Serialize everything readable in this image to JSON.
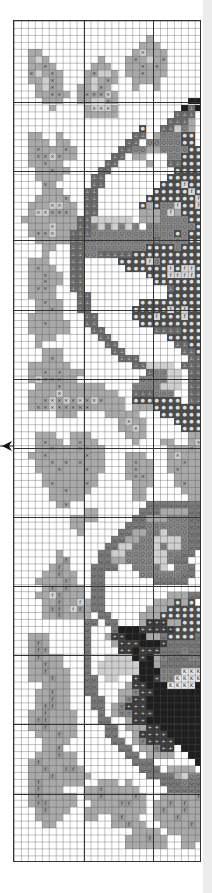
{
  "chart_info": {
    "type": "cross-stitch pattern chart",
    "columns": 27,
    "rows": 121,
    "major_grid_every": 10,
    "center_marker": "arrow-left-edge"
  },
  "palette": {
    ".": {
      "color": "#ffffff",
      "symbol": ""
    },
    "p": {
      "color": "#e2e2e2",
      "symbol": ""
    },
    "a": {
      "color": "#cfcfcf",
      "symbol": ""
    },
    "b": {
      "color": "#a9a9a9",
      "symbol": ""
    },
    "c": {
      "color": "#a5a5a5",
      "symbol": "×"
    },
    "x": {
      "color": "#cfcfcf",
      "symbol": "×"
    },
    "d": {
      "color": "#6a6a6a",
      "symbol": "⊥"
    },
    "o": {
      "color": "#8c8c8c",
      "symbol": "○"
    },
    "e": {
      "color": "#4a4a4a",
      "symbol": "●"
    },
    "f": {
      "color": "#d6d6d6",
      "symbol": "f"
    },
    "g": {
      "color": "#9a9a9a",
      "symbol": "f"
    },
    "s": {
      "color": "#7a7a7a",
      "symbol": "◡"
    },
    "k": {
      "color": "#1e1e1e",
      "symbol": ""
    },
    "m": {
      "color": "#3a3a3a",
      "symbol": "+"
    },
    "t": {
      "color": "#888888",
      "symbol": "☆"
    },
    "K": {
      "color": "#e8e8e8",
      "symbol": "K"
    }
  },
  "grid": [
    "...........................",
    "...........................",
    "...................b.......",
    "..................bbb......",
    "..bb.............bxbbb.....",
    "..bab.......b...bcbabc.....",
    "..bbcb.....bbb..bbcbcb.....",
    "..cabcb...bcaab.bbcbbb.....",
    "..bbacb...babcb..bbbb......",
    "...bacb..bbacb...b..b......",
    "...bbccb.bcccxb............",
    "....bbb..bbaacb..........kk",
    ".....b....bxxxb.........kdk",
    "..........bbbbb........ddd.",
    "......................dddb.",
    "..................e..ddaob.",
    "..bb..b..........dd.boooee.",
    "..bbb.bb........dd.oooooee.",
    "..bcbbbcb......ddoobbooooee",
    "..bccxcbb.....dd.bb...ooeee",
    "..bbcbb......dd....b..ddeee",
    "...bbcbb....dd.........eeee",
    "...bbbb....dd.........eeeee",
    "....cb.....dd........eeefee",
    "....bbb...dd........eeeeefe",
    "...bbbbc..dd.......eeeeeeef",
    "..bbbxxbb.dd......ebeoofeef",
    "..bxxcccb.dd......bbbofbeee",
    ".bbbbbbbbddaaaaaa.bbbooooee",
    "..bbbxbbbddoaoaoao.oooooooe",
    "..bccxbbdddooooooooooooeoee",
    "...bbbbbddoooooooooodooooee",
    "....bb..ddoooooooooeeeeoeee",
    "....b...ddoodddddeeeeeeeeee",
    "..bbb...dd.....eeeefoeeeeee",
    "..bcbb..dd......eeeeeefeffe",
    "..bbcbb.dd.........eeeffffe",
    "..bbcbb.dd..........eeeeeee",
    "..bccb..dd............deeee",
    "..bbbb...dd...........eeeee",
    "...bcbb..dd.......eeeeeeeee",
    "...bbcb..dd......eeeeefefee",
    "..bbbbb...dd.....eeefeeefee",
    "..bbcbbb..dd......eeeeeeeee",
    "..bbbbbb...dd.......ddddeee",
    "...bbb......dd........eeeee",
    "...b.........dd........ddee",
    "....bbb.......dd........dde",
    "....bcb........ddd.......dd",
    "..bbbbbb.........ddaaaa.ddd",
    "..bbcbcbbb.........dooaa.dd",
    "..bxcccbb.........ooooaa.dd",
    "...bbbcbbbbbb....ooooaaa.dd",
    "..bbbbxbbbbbbbb..dddooo..dd",
    "..bbcxcxcxcxcbbb.eeeeeee.dd",
    "..bccxcccccbbbbb.bbbeeeeeee",
    "......bbb....bbbbb...eeeeee",
    "...............bxbb....eeee",
    "...............bbxb.....eee",
    "...bbb..bbb.....bbb......bb",
    "...bcbb.bcbb.....b...bb..bx",
    "...bbcbbbccbb.........bbbcb",
    "..bbcbbbbbcbb...bbb...bxbbb",
    "...bbcbcbcbbb...bcbb..bbcbb",
    "...bbbcbbbcbb...bcbb..bcbbb",
    "....bbbbbbbb....bccb...bbbb",
    "....bcbbbbcb.....bbb...bcbb",
    ".....bbcbbb......bb.....bbb",
    ".....bbbbb.......bb......bb",
    "......bc...........ssssssss",
    "..........bb......sssbbbbss",
    "........bbbb.....ssbbboooss",
    "........bb......sssooooooss",
    ".........b.....ssbbooaoooss",
    "..............ssbbooaaaaoss",
    ".............ssaaoooaoaaoss",
    "......b.....ssaaooooaaooss.",
    "......bg....ssbbooooaaoss..",
    ".....bgb...ssss..ooooa.oos.",
    "....bbgbb..ss.....ooooooss.",
    "...bbbbgb..ss.......sssss..",
    "....bgbgbb.ss..............",
    "...bbfgbbb.ss.........bbbss",
    "....bbgbbfbss.......bbbebe.",
    "....bggbfgbss......bbbeeeee",
    "....bbgbbbb.ss....bbbeeeeee",
    "..........ss.ss...bmmmbbeee",
    "..........s...skkkmmmmmeeee",
    "..bbb.....s..bmmkkkbbseeees",
    "..bgb.....s...bmmmkkkmsssss",
    "..bgg.....s....mmkmmmssstss",
    "..bgbbb...s..aaaakmkbtssstt",
    "..bbgbb...s.aaaaaakkbssssss",
    "..bbgbbb..s.aaaaaakkktttKKK",
    "..bbbgbb..ss.aa..mkkmttKKKK",
    "....bbbb..ss....bmmkkkKKKKk",
    "...bbgbb..ss...bbtmmkkkkkkk",
    "...bbgbb...ss..btmmkkkkkkkk",
    "...bggbb...ss.btmmmkkkkkkkk",
    "..bbgbbbb...s.bttmmmkkkkkkk",
    "..bggbbbb...ss..bmmkkkkkkkk",
    "..bbgbbbb....ss.bbbmmkkkkkk",
    "...bbbgbb....ss..bmmmmkkkkk",
    "....bbbb......ss.btmmmmkkkk",
    "....bbg........ss.bbtmm.kkk",
    "...bbbgbb.......ss.bbbb..kk",
    "..bgbbbbb........sss......k",
    "..bbgbbggb........sss.bbbb.",
    "..bbbgbbbbb........ssssbaoo",
    "..bgbbbbbb..bbb.b....sssoss",
    "..bgbbb...bbgbbbbb....sssss",
    "..bgbbbbb.bbgbbbbgb..bbbbbg",
    "..bggbbbb..bbbbggbb.bbgbgbb",
    "...bgbbb..bbbbbbbbb.bgbbgbb",
    "...bbbb...bb..bgbb..bbbgbbb",
    "....bb........bbgbb..bbbbgb",
    ".................bbbb.bbbbb",
    "................bbbgbb..bbb",
    "................bbbbbb..bb.",
    "...........................",
    "..........................."
  ],
  "major_lines": {
    "vertical_px": [
      69.6,
      139.2
    ],
    "horizontal_px": [
      81,
      150,
      219,
      289,
      358,
      427,
      496,
      565,
      634,
      703,
      773
    ]
  }
}
